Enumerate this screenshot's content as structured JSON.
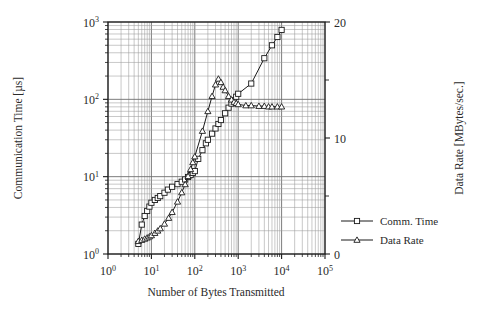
{
  "chart_data": {
    "type": "line",
    "title": "",
    "xlabel": "Number of Bytes Transmitted",
    "ylabel_left": "Communication Time [µs]",
    "ylabel_right": "Data Rate [MBytes/sec.]",
    "xscale": "log",
    "yscale_left": "log",
    "yscale_right": "linear",
    "xlim": [
      1,
      100000
    ],
    "ylim_left": [
      1,
      1000
    ],
    "ylim_right": [
      0,
      20
    ],
    "grid": true,
    "grid_minor": true,
    "legend_position": "right",
    "x_ticks": [
      "10 0",
      "10 1",
      "10 2",
      "10 3",
      "10 4",
      "10 5"
    ],
    "x_tick_values": [
      1,
      10,
      100,
      1000,
      10000,
      100000
    ],
    "y_ticks_left": [
      "10 0",
      "10 1",
      "10 2",
      "10 3"
    ],
    "y_tick_values_left": [
      1,
      10,
      100,
      1000
    ],
    "y_ticks_right": [
      "0",
      "10",
      "20"
    ],
    "y_tick_values_right": [
      0,
      10,
      20
    ],
    "y_minor_ticks_right": [
      5,
      15
    ],
    "series": [
      {
        "name": "Comm. Time",
        "axis": "left",
        "marker": "square",
        "color": "#1a1a1a",
        "x": [
          5,
          6,
          7,
          8,
          9,
          10,
          12,
          14,
          16,
          20,
          24,
          30,
          40,
          50,
          60,
          70,
          80,
          90,
          100,
          120,
          150,
          180,
          200,
          250,
          300,
          350,
          400,
          500,
          600,
          700,
          800,
          900,
          1000,
          2000,
          4000,
          6000,
          8000,
          10000
        ],
        "y": [
          1.35,
          2.4,
          3.1,
          3.6,
          4.1,
          4.6,
          5.0,
          5.3,
          5.6,
          6.2,
          6.8,
          7.4,
          8.0,
          8.6,
          9.2,
          9.9,
          10.5,
          11.2,
          11.8,
          17.0,
          22.0,
          27.0,
          30.0,
          36.0,
          42.0,
          48.0,
          54.0,
          66.0,
          78.0,
          88.0,
          98.0,
          108.0,
          118.0,
          160.0,
          340.0,
          500.0,
          640.0,
          790.0
        ]
      },
      {
        "name": "Data Rate",
        "axis": "right",
        "marker": "triangle",
        "color": "#1a1a1a",
        "x": [
          5,
          6,
          7,
          8,
          9,
          10,
          12,
          14,
          16,
          20,
          25,
          30,
          40,
          50,
          60,
          70,
          80,
          90,
          100,
          150,
          200,
          250,
          300,
          350,
          400,
          450,
          500,
          600,
          700,
          800,
          900,
          1000,
          1500,
          2000,
          3000,
          4000,
          5000,
          6000,
          8000,
          10000
        ],
        "y": [
          1.1,
          1.2,
          1.3,
          1.4,
          1.5,
          1.6,
          1.8,
          2.0,
          2.2,
          2.6,
          3.1,
          3.6,
          4.5,
          5.3,
          6.0,
          6.7,
          7.3,
          7.9,
          8.4,
          10.6,
          12.3,
          13.6,
          14.6,
          15.1,
          14.8,
          14.4,
          14.1,
          13.6,
          13.3,
          13.1,
          13.0,
          12.9,
          12.8,
          12.8,
          12.75,
          12.75,
          12.7,
          12.7,
          12.7,
          12.7
        ]
      }
    ],
    "legend": [
      {
        "label": "Comm. Time",
        "marker": "square"
      },
      {
        "label": "Data Rate",
        "marker": "triangle"
      }
    ]
  },
  "colors": {
    "axis": "#1a1a1a",
    "grid_major": "#6e6e6e",
    "grid_minor": "#9a9a9a",
    "text": "#2a2a2a",
    "background": "#ffffff"
  }
}
